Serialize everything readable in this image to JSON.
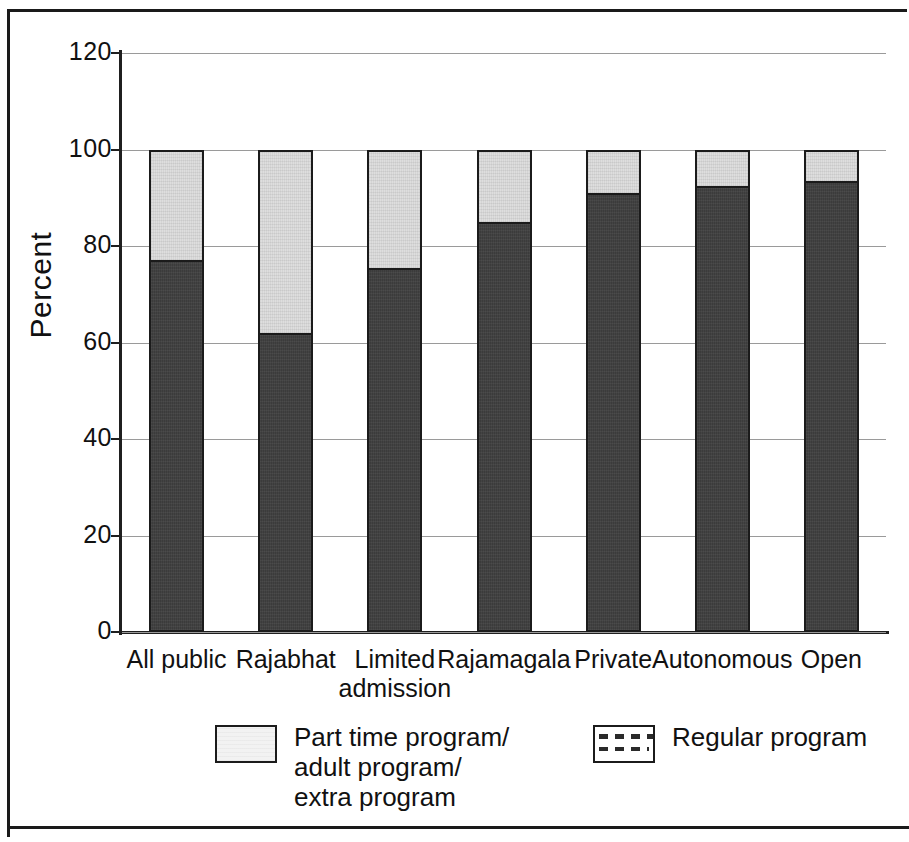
{
  "chart_data": {
    "type": "bar",
    "subtype": "stacked-bar",
    "title": "",
    "xlabel": "",
    "ylabel": "Percent",
    "ylim": [
      0,
      120
    ],
    "yticks": [
      "0",
      "20",
      "40",
      "60",
      "80",
      "100",
      "120"
    ],
    "ytick_values": [
      0,
      20,
      40,
      60,
      80,
      100,
      120
    ],
    "grid": true,
    "grid_axis": "y",
    "legend_position": "bottom",
    "stacked_total": 100,
    "categories": [
      "All public",
      "Rajabhat",
      "Limited admission",
      "Rajamagala",
      "Private",
      "Autonomous",
      "Open"
    ],
    "category_lines": [
      [
        "All public"
      ],
      [
        "Rajabhat"
      ],
      [
        "Limited",
        "admission"
      ],
      [
        "Rajamagala"
      ],
      [
        "Private"
      ],
      [
        "Autonomous"
      ],
      [
        "Open"
      ]
    ],
    "series": [
      {
        "name": "Regular program",
        "swatch": "dashed-pattern",
        "fill": "#3b3b3b",
        "values": [
          77,
          62,
          75.5,
          85,
          91,
          92.5,
          93.5
        ]
      },
      {
        "name": "Part time program/\nadult program/\nextra program",
        "swatch": "light-fill",
        "fill": "#dedede",
        "values": [
          23,
          38,
          24.5,
          15,
          9,
          7.5,
          6.5
        ]
      }
    ],
    "legend": [
      {
        "label": "Part time program/\nadult program/\nextra program",
        "swatch": "light-fill"
      },
      {
        "label": "Regular program",
        "swatch": "dashed-pattern"
      }
    ],
    "colors": {
      "regular_program": "#3b3b3b",
      "part_time_program": "#dedede",
      "axis": "#1f1f1f",
      "gridline": "#9a9a9a",
      "border": "#1b1b1b",
      "background": "#ffffff"
    }
  }
}
